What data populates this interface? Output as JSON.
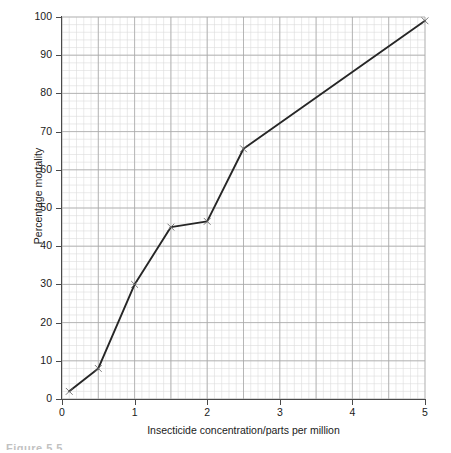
{
  "figure": {
    "caption_fragment": "Figure 5.5"
  },
  "chart_data": {
    "type": "line",
    "title": "",
    "xlabel": "Insecticide concentration/parts per million",
    "ylabel": "Percentage mortality",
    "xlim": [
      0,
      5
    ],
    "ylim": [
      0,
      100
    ],
    "xticks": [
      0,
      1,
      2,
      3,
      4,
      5
    ],
    "yticks": [
      0,
      10,
      20,
      30,
      40,
      50,
      60,
      70,
      80,
      90,
      100
    ],
    "xtick_labels": [
      "0",
      "1",
      "2",
      "3",
      "4",
      "5"
    ],
    "ytick_labels": [
      "0",
      "10",
      "20",
      "30",
      "40",
      "50",
      "60",
      "70",
      "80",
      "90",
      "100"
    ],
    "grid": true,
    "grid_minor_step_x": 0.1,
    "grid_minor_step_y": 2,
    "grid_major_step_x": 0.5,
    "grid_major_step_y": 10,
    "legend": null,
    "marker": "x",
    "line_color": "#262626",
    "grid_minor_color": "#dcdcdc",
    "grid_major_color": "#a8a8a8",
    "axis_color": "#4a4a4a",
    "series": [
      {
        "name": "percentage mortality",
        "x": [
          0.1,
          0.5,
          1.0,
          1.5,
          2.0,
          2.5,
          5.0
        ],
        "y": [
          2,
          8,
          30,
          45,
          46.5,
          65.5,
          99
        ]
      }
    ]
  }
}
